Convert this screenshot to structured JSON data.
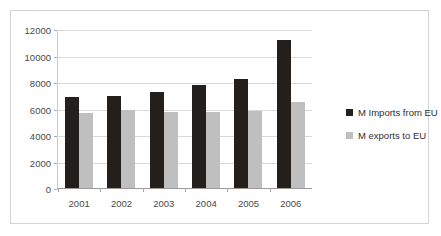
{
  "chart_data": {
    "type": "bar",
    "title": "",
    "xlabel": "",
    "ylabel": "",
    "categories": [
      "2001",
      "2002",
      "2003",
      "2004",
      "2005",
      "2006"
    ],
    "series": [
      {
        "name": "M Imports from EU",
        "color": "#231f1d",
        "values": [
          6900,
          6950,
          7250,
          7750,
          8200,
          11200
        ]
      },
      {
        "name": "M exports to EU",
        "color": "#bfbfbf",
        "values": [
          5650,
          5900,
          5700,
          5700,
          5820,
          6500
        ]
      }
    ],
    "ylim": [
      0,
      12000
    ],
    "ytick_labels": [
      "12000",
      "10000",
      "8000",
      "6000",
      "4000",
      "2000",
      "0"
    ],
    "ytick_values": [
      12000,
      10000,
      8000,
      6000,
      4000,
      2000,
      0
    ],
    "grid": true,
    "legend_position": "right"
  },
  "legend": {
    "items": [
      {
        "label": "M Imports from EU",
        "color": "#231f1d"
      },
      {
        "label": "M exports to EU",
        "color": "#bfbfbf"
      }
    ]
  },
  "colors": {
    "imports": "#231f1d",
    "exports": "#bfbfbf",
    "gridline": "#d9d9d9",
    "frame_border": "#d4d4d4",
    "background": "#ffffff",
    "tick_text": "#4a4a4a"
  }
}
